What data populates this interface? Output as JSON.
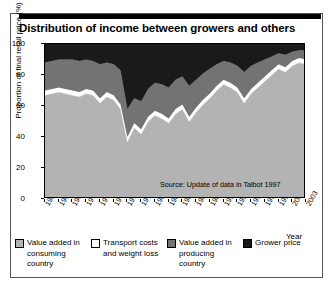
{
  "figure": {
    "title": "Distribution of income between growers and others",
    "source": "Source: Update of data in Talbot 1997"
  },
  "chart_data": {
    "type": "area",
    "title": "Distribution of income between growers and others",
    "subtitle": "",
    "xlabel": "Year",
    "ylabel": "Proportion of final retail price (%)",
    "xlim": [
      1965,
      2003
    ],
    "ylim": [
      0,
      100
    ],
    "yticks": [
      0,
      20,
      40,
      60,
      80,
      100
    ],
    "xticks": [
      1965,
      1967,
      1969,
      1971,
      1973,
      1975,
      1977,
      1979,
      1981,
      1983,
      1985,
      1987,
      1989,
      1991,
      1993,
      1995,
      1997,
      1999,
      2001,
      2003
    ],
    "grid": false,
    "stacked": true,
    "legend_position": "bottom",
    "annotations": [
      "Source: Update of data in Talbot 1997"
    ],
    "x": [
      1965,
      1966,
      1967,
      1968,
      1969,
      1970,
      1971,
      1972,
      1973,
      1974,
      1975,
      1976,
      1977,
      1978,
      1979,
      1980,
      1981,
      1982,
      1983,
      1984,
      1985,
      1986,
      1987,
      1988,
      1989,
      1990,
      1991,
      1992,
      1993,
      1994,
      1995,
      1996,
      1997,
      1998,
      1999,
      2000,
      2001,
      2002,
      2003
    ],
    "series": [
      {
        "name": "Value added in consuming country",
        "color": "#b3b3b3",
        "values": [
          67,
          68,
          69,
          68,
          67,
          66,
          68,
          67,
          62,
          66,
          64,
          58,
          37,
          46,
          42,
          50,
          54,
          52,
          49,
          55,
          58,
          50,
          56,
          61,
          65,
          70,
          74,
          72,
          69,
          62,
          68,
          72,
          76,
          80,
          84,
          82,
          86,
          88,
          87
        ]
      },
      {
        "name": "Transport costs and weight loss",
        "color": "#ffffff",
        "values": [
          3,
          3,
          3,
          3,
          3,
          3,
          3,
          3,
          3,
          3,
          3,
          3,
          3,
          3,
          3,
          3,
          3,
          3,
          3,
          3,
          3,
          3,
          3,
          3,
          3,
          3,
          3,
          3,
          3,
          3,
          3,
          3,
          3,
          3,
          3,
          3,
          3,
          3,
          3
        ]
      },
      {
        "name": "Value added in producing country",
        "color": "#737373",
        "values": [
          18,
          18,
          18,
          19,
          20,
          20,
          19,
          19,
          22,
          19,
          20,
          22,
          18,
          16,
          18,
          18,
          18,
          19,
          20,
          19,
          18,
          20,
          18,
          17,
          16,
          14,
          12,
          13,
          14,
          17,
          15,
          13,
          11,
          9,
          7,
          8,
          6,
          5,
          6
        ]
      },
      {
        "name": "Grower price",
        "color": "#1a1a1a",
        "values": [
          12,
          11,
          10,
          10,
          10,
          11,
          10,
          11,
          13,
          12,
          13,
          17,
          42,
          35,
          37,
          29,
          25,
          26,
          28,
          23,
          21,
          27,
          23,
          19,
          16,
          13,
          11,
          12,
          14,
          18,
          14,
          12,
          10,
          8,
          6,
          7,
          5,
          4,
          4
        ]
      }
    ]
  },
  "legend": {
    "items": [
      {
        "label": "Value added in consuming country",
        "color": "#b3b3b3"
      },
      {
        "label": "Transport costs and weight loss",
        "color": "#ffffff"
      },
      {
        "label": "Value added in producing country",
        "color": "#737373"
      },
      {
        "label": "Grower price",
        "color": "#1a1a1a"
      }
    ]
  },
  "axes": {
    "y_label": "Proportion of final retail price (%)",
    "x_label": "Year",
    "y_ticks": [
      "0",
      "20",
      "40",
      "60",
      "80",
      "100"
    ],
    "x_ticks": [
      "1965",
      "1967",
      "1969",
      "1971",
      "1973",
      "1975",
      "1977",
      "1979",
      "1981",
      "1983",
      "1985",
      "1987",
      "1989",
      "1991",
      "1993",
      "1995",
      "1997",
      "1999",
      "2001",
      "2003"
    ]
  }
}
